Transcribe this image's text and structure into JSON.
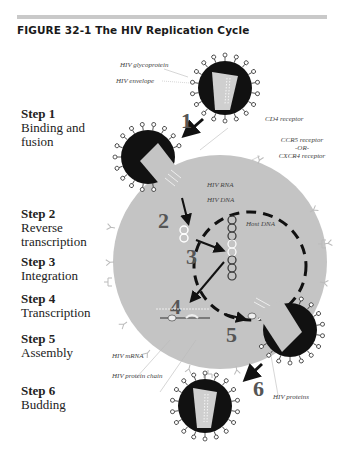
{
  "figure": {
    "title": "FIGURE 32-1  The HIV Replication Cycle"
  },
  "steps": [
    {
      "number": "Step 1",
      "description_lines": [
        "Binding and",
        "fusion"
      ],
      "diagram_numeral": "1"
    },
    {
      "number": "Step 2",
      "description_lines": [
        "Reverse",
        "transcription"
      ],
      "diagram_numeral": "2"
    },
    {
      "number": "Step 3",
      "description_lines": [
        "Integration"
      ],
      "diagram_numeral": "3"
    },
    {
      "number": "Step 4",
      "description_lines": [
        "Transcription"
      ],
      "diagram_numeral": "4"
    },
    {
      "number": "Step 5",
      "description_lines": [
        "Assembly"
      ],
      "diagram_numeral": "5"
    },
    {
      "number": "Step 6",
      "description_lines": [
        "Budding"
      ],
      "diagram_numeral": "6"
    }
  ],
  "labels": {
    "hiv_glycoprotein": "HIV glycoprotein",
    "hiv_envelope": "HIV envelope",
    "cd4_receptor": "CD4 receptor",
    "ccr5_receptor": "CCR5 receptor",
    "or": "-OR-",
    "cxcr4_receptor": "CXCR4 receptor",
    "hiv_rna": "HIV RNA",
    "hiv_dna": "HIV DNA",
    "host_dna": "Host DNA",
    "hiv_mrna": "HIV mRNA",
    "hiv_protein_chain": "HIV protein chain",
    "hiv_proteins": "HIV proteins"
  },
  "colors": {
    "cell": "#c4c4c4",
    "virion_shell": "#111111",
    "capsid": "#cfcfcf",
    "arrow": "#111111",
    "numeral": "#555555",
    "rule": "#c9c9c9"
  }
}
